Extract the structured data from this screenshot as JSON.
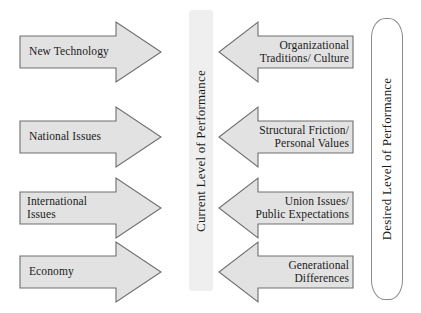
{
  "diagram": {
    "type": "force-field-analysis",
    "canvas": {
      "width": 421,
      "height": 313,
      "background": "#ffffff"
    },
    "colors": {
      "arrow_fill": "#e2e2e2",
      "arrow_stroke": "#6e6e6e",
      "text": "#1a1a1a",
      "current_bar_fill": "#efefef",
      "desired_bar_stroke": "#8a8a8a"
    },
    "driving_forces": [
      {
        "label": "New Technology",
        "direction": "right"
      },
      {
        "label": "National Issues",
        "direction": "right"
      },
      {
        "label": "International Issues",
        "direction": "right"
      },
      {
        "label": "Economy",
        "direction": "right"
      }
    ],
    "restraining_forces": [
      {
        "label": "Organizational\nTraditions/ Culture",
        "direction": "left"
      },
      {
        "label": "Structural Friction/\nPersonal Values",
        "direction": "left"
      },
      {
        "label": "Union Issues/\nPublic Expectations",
        "direction": "left"
      },
      {
        "label": "Generational\nDifferences",
        "direction": "left"
      }
    ],
    "bars": {
      "current": {
        "label": "Current Level of Performance"
      },
      "desired": {
        "label": "Desired Level of Performance"
      }
    }
  }
}
